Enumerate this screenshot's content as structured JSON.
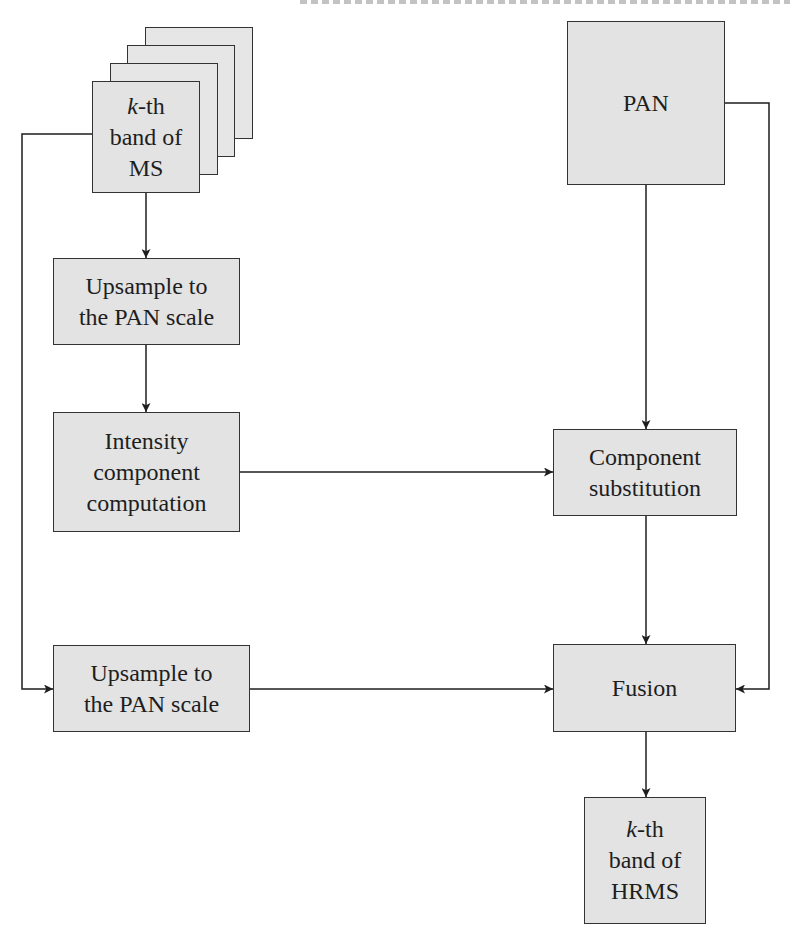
{
  "diagram": {
    "type": "flowchart",
    "title": "",
    "header_fragment": "",
    "colors": {
      "box_fill": "#e3e3e3",
      "box_border": "#333333",
      "line": "#1e1e1e",
      "background": "#ffffff"
    },
    "nodes": {
      "ms": {
        "k": "k",
        "line1_suffix": "-th",
        "line2": "band of",
        "line3": "MS",
        "stacked_layers": 4
      },
      "pan": {
        "label": "PAN"
      },
      "upsample1": {
        "line1": "Upsample to",
        "line2": "the PAN scale"
      },
      "intensity": {
        "line1": "Intensity",
        "line2": "component",
        "line3": "computation"
      },
      "component": {
        "line1": "Component",
        "line2": "substitution"
      },
      "upsample2": {
        "line1": "Upsample to",
        "line2": "the PAN scale"
      },
      "fusion": {
        "label": "Fusion"
      },
      "hrms": {
        "k": "k",
        "line1_suffix": "-th",
        "line2": "band of",
        "line3": "HRMS"
      }
    },
    "edges": [
      {
        "from": "ms",
        "to": "upsample1"
      },
      {
        "from": "upsample1",
        "to": "intensity"
      },
      {
        "from": "intensity",
        "to": "component"
      },
      {
        "from": "pan",
        "to": "component"
      },
      {
        "from": "ms",
        "to": "upsample2"
      },
      {
        "from": "component",
        "to": "fusion"
      },
      {
        "from": "upsample2",
        "to": "fusion"
      },
      {
        "from": "pan",
        "to": "fusion"
      },
      {
        "from": "fusion",
        "to": "hrms"
      }
    ]
  }
}
